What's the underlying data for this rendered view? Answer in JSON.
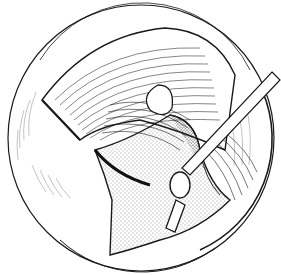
{
  "illustration": {
    "type": "surgical line drawing",
    "view": "circular operative field",
    "elements": [
      "outer-field-circle",
      "retracted-tissue-flap",
      "muscle-fibers",
      "stippled-tissue",
      "instrument-rod",
      "instrument-tip",
      "clip"
    ],
    "colors": {
      "ink": "#1a1a1a",
      "background": "#ffffff"
    }
  }
}
